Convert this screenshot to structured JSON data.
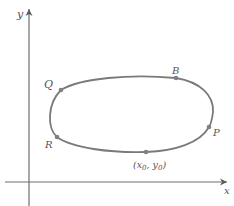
{
  "diagram": {
    "axes": {
      "x_label": "x",
      "y_label": "y"
    },
    "curve": {
      "description": "closed smooth curve (level curve)",
      "stroke_color": "#7a7a7a"
    },
    "points": [
      {
        "id": "Q",
        "label": "Q"
      },
      {
        "id": "B",
        "label": "B"
      },
      {
        "id": "P",
        "label": "P"
      },
      {
        "id": "x0y0",
        "label": "(x0, y0)",
        "label_parts": [
          "(x",
          "0",
          ", y",
          "0",
          ")"
        ]
      },
      {
        "id": "R",
        "label": "R"
      }
    ],
    "colors": {
      "axis": "#6e6e6e",
      "curve": "#7a7a7a",
      "point": "#808080",
      "label": "#555555"
    }
  }
}
